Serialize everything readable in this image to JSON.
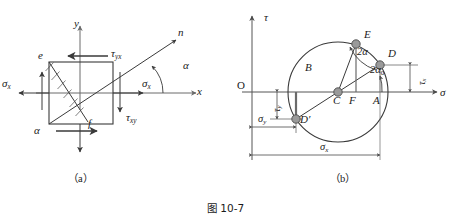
{
  "figure": {
    "caption": "图 10-7",
    "panel_a_label": "（a）",
    "panel_b_label": "（b）"
  },
  "panel_a": {
    "name": "stress-element-diagram",
    "axes": {
      "y_label": "y",
      "x_label": "x",
      "n_label": "n"
    },
    "angles": {
      "alpha_axis": "α",
      "alpha_element": "α"
    },
    "element_corners": {
      "e": "e",
      "f": "f"
    },
    "stresses": {
      "sigma_x_left": "σx",
      "sigma_x_right": "σx",
      "tau_yx": "τyx",
      "tau_xy": "τxy"
    },
    "greek": {
      "sigma": "σ",
      "tau": "τ",
      "alpha": "α"
    }
  },
  "panel_b": {
    "name": "mohr-circle-diagram",
    "axes": {
      "tau_label": "τ",
      "sigma_label": "σ",
      "origin_label": "O"
    },
    "points": [
      {
        "id": "E",
        "label": "E"
      },
      {
        "id": "D",
        "label": "D"
      },
      {
        "id": "D_prime",
        "label": "D′"
      },
      {
        "id": "B",
        "label": "B"
      },
      {
        "id": "C",
        "label": "C"
      },
      {
        "id": "F",
        "label": "F"
      },
      {
        "id": "A",
        "label": "A"
      }
    ],
    "angles": {
      "two_alpha": "2α",
      "two_alpha_zero": "2α0"
    },
    "dimensions": {
      "tau_x": "τx",
      "tau_y": "τy",
      "sigma_y": "σy",
      "sigma_x": "σx"
    }
  },
  "colors": {
    "stroke": "#3a3a3a",
    "axis": "#555555",
    "marker_fill": "#9a9a9a",
    "marker_stroke": "#4a4a4a",
    "text": "#1a1a1a",
    "background": "#ffffff"
  }
}
